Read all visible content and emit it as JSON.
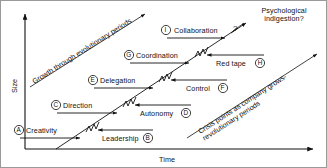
{
  "diagram": {
    "type": "greiner-growth-model",
    "axes": {
      "y_label": "Size",
      "x_label": "Time"
    },
    "annotations": {
      "growth_line": "Growth through evolutionary periods",
      "crisis_line": "Crisis points as company grows-revolutionary periods",
      "top_right": "Psychological indigestion?",
      "question_mark": "?"
    },
    "phases": [
      {
        "key": "A",
        "marker": "A",
        "label": "Creativity",
        "kind": "evolution",
        "arrow": "right"
      },
      {
        "key": "B",
        "marker": "B",
        "label": "Leadership",
        "kind": "revolution",
        "arrow": "left"
      },
      {
        "key": "C",
        "marker": "C",
        "label": "Direction",
        "kind": "evolution",
        "arrow": "right"
      },
      {
        "key": "D",
        "marker": "D",
        "label": "Autonomy",
        "kind": "revolution",
        "arrow": "left"
      },
      {
        "key": "E",
        "marker": "E",
        "label": "Delegation",
        "kind": "evolution",
        "arrow": "right"
      },
      {
        "key": "F",
        "marker": "F",
        "label": "Control",
        "kind": "revolution",
        "arrow": "left"
      },
      {
        "key": "G",
        "marker": "G",
        "label": "Coordination",
        "kind": "evolution",
        "arrow": "right"
      },
      {
        "key": "H",
        "marker": "H",
        "label": "Red tape",
        "kind": "revolution",
        "arrow": "left"
      },
      {
        "key": "I",
        "marker": "I",
        "label": "Collaboration",
        "kind": "evolution",
        "arrow": "right"
      }
    ],
    "colors": {
      "ink": "#111111",
      "background": "#ffffff",
      "border": "#9a9a9a"
    }
  }
}
